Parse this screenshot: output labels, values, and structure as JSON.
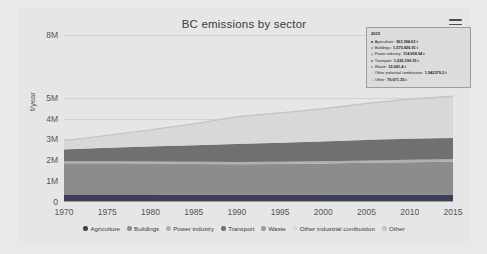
{
  "chart_data": {
    "type": "area",
    "stacked": true,
    "title": "BC emissions by sector",
    "xlabel": "",
    "ylabel": "t/year",
    "grid": true,
    "legend_position": "bottom",
    "xlim": [
      1970,
      2015
    ],
    "ylim": [
      0,
      8000000
    ],
    "ytick_labels": [
      "0",
      "1M",
      "2M",
      "3M",
      "4M",
      "5M",
      "8M"
    ],
    "ytick_values": [
      0,
      1000000,
      2000000,
      3000000,
      4000000,
      5000000,
      8000000
    ],
    "xtick_labels": [
      "1970",
      "1975",
      "1980",
      "1985",
      "1990",
      "1995",
      "2000",
      "2005",
      "2010",
      "2015"
    ],
    "xtick_values": [
      1970,
      1975,
      1980,
      1985,
      1990,
      1995,
      2000,
      2005,
      2010,
      2015
    ],
    "x": [
      1970,
      1975,
      1980,
      1985,
      1990,
      1995,
      2000,
      2005,
      2010,
      2015
    ],
    "series": [
      {
        "name": "Agriculture",
        "color": "#3d3d5c",
        "values": [
          330000,
          335000,
          340000,
          345000,
          350000,
          352000,
          355000,
          358000,
          360000,
          363185
        ]
      },
      {
        "name": "Buildings",
        "color": "#8c8c8c",
        "values": [
          1530000,
          1520000,
          1500000,
          1480000,
          1460000,
          1470000,
          1490000,
          1520000,
          1550000,
          1570827
        ]
      },
      {
        "name": "Power industry",
        "color": "#b0b0b0",
        "values": [
          95000,
          100000,
          105000,
          108000,
          110000,
          111000,
          112000,
          113000,
          114000,
          114959
        ]
      },
      {
        "name": "Transport",
        "color": "#707070",
        "values": [
          560000,
          640000,
          710000,
          780000,
          860000,
          900000,
          940000,
          980000,
          1005000,
          1020199
        ]
      },
      {
        "name": "Waste",
        "color": "#9a9a9a",
        "values": [
          9000,
          9500,
          10000,
          10500,
          11000,
          11200,
          11500,
          11700,
          11900,
          12041
        ]
      },
      {
        "name": "Other industrial combustion",
        "color": "#d8d8d8",
        "values": [
          390000,
          560000,
          760000,
          980000,
          1260000,
          1380000,
          1520000,
          1700000,
          1850000,
          1942379
        ]
      },
      {
        "name": "Other",
        "color": "#c4c4c4",
        "values": [
          52000,
          56000,
          60000,
          64000,
          68000,
          70000,
          72000,
          74000,
          75500,
          76671
        ]
      }
    ],
    "annotations": {
      "tooltip": {
        "year": "2015",
        "rows": [
          {
            "name": "Agriculture",
            "value": "363,184.63 t",
            "color": "#3d3d5c"
          },
          {
            "name": "Buildings",
            "value": "1,570,826.91 t",
            "color": "#8c8c8c"
          },
          {
            "name": "Power industry",
            "value": "114,958.94 t",
            "color": "#b0b0b0"
          },
          {
            "name": "Transport",
            "value": "1,020,199.15 t",
            "color": "#707070"
          },
          {
            "name": "Waste",
            "value": "12,041.4 t",
            "color": "#9a9a9a"
          },
          {
            "name": "Other industrial combustion",
            "value": "1,942379.2 t",
            "color": "#d8d8d8"
          },
          {
            "name": "Other",
            "value": "76,671.35 t",
            "color": "#c4c4c4"
          }
        ],
        "total_label": "Total: 5104267.28 t"
      }
    }
  },
  "header": {
    "title": "BC emissions by sector",
    "menu_icon": "hamburger-menu-icon"
  },
  "axes": {
    "y_label": "t/year",
    "y_ticks": [
      "8M",
      "5M",
      "4M",
      "3M",
      "2M",
      "1M",
      "0"
    ],
    "x_ticks": [
      "1970",
      "1975",
      "1980",
      "1985",
      "1990",
      "1995",
      "2000",
      "2005",
      "2010",
      "2015"
    ]
  },
  "tooltip": {
    "year": "2015",
    "rows": [
      {
        "label": "Agriculture:",
        "value": "363,184.63 t"
      },
      {
        "label": "Buildings:",
        "value": "1,570,826.91 t"
      },
      {
        "label": "Power industry:",
        "value": "114,958.94 t"
      },
      {
        "label": "Transport:",
        "value": "1,020,199.15 t"
      },
      {
        "label": "Waste:",
        "value": "12,041.4 t"
      },
      {
        "label": "Other industrial combustion:",
        "value": "1,942379.2 t"
      },
      {
        "label": "Other:",
        "value": "76,671.35 t"
      }
    ],
    "total": "Total: 5104267.28 t"
  },
  "legend": {
    "items": [
      {
        "label": "Agriculture",
        "color": "#3d3d5c"
      },
      {
        "label": "Buildings",
        "color": "#8c8c8c"
      },
      {
        "label": "Power industry",
        "color": "#b0b0b0"
      },
      {
        "label": "Transport",
        "color": "#707070"
      },
      {
        "label": "Waste",
        "color": "#9a9a9a"
      },
      {
        "label": "Other industrial combustion",
        "color": "#d8d8d8"
      },
      {
        "label": "Other",
        "color": "#c4c4c4"
      }
    ]
  }
}
